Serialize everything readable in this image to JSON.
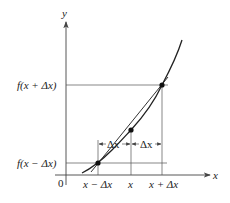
{
  "diagram": {
    "axes": {
      "x_label": "x",
      "y_label": "y",
      "origin_label": "0"
    },
    "y_tick_labels": {
      "upper": "f(x + Δx)",
      "lower": "f(x − Δx)"
    },
    "x_tick_labels": {
      "left": "x − Δx",
      "center": "x",
      "right": "x + Δx"
    },
    "interval_labels": {
      "left": "Δx",
      "right": "Δx"
    },
    "points": [
      {
        "name": "P(x−Δx)",
        "x": -1,
        "y": "f(x−Δx)"
      },
      {
        "name": "P(x)",
        "x": 0,
        "y": "f(x)"
      },
      {
        "name": "P(x+Δx)",
        "x": 1,
        "y": "f(x+Δx)"
      }
    ],
    "elements": [
      "increasing convex curve y=f(x)",
      "secant line through (x−Δx, f(x−Δx)) and (x+Δx, f(x+Δx))"
    ]
  }
}
